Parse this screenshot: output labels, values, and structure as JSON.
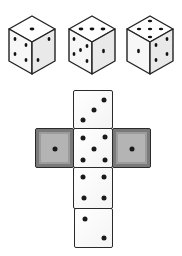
{
  "colors": {
    "outline": "#2a2a2a",
    "pip": "#1a1a1a",
    "face": "#ffffff",
    "shaded_face": "#9c9c9c"
  },
  "dice": [
    {
      "label": "die-1",
      "top": 1,
      "left": 4,
      "right": 2
    },
    {
      "label": "die-2",
      "top": 3,
      "left": 5,
      "right": 1
    },
    {
      "label": "die-3",
      "top": 5,
      "left": 1,
      "right": 4
    }
  ],
  "net": {
    "faces": [
      {
        "position": "top",
        "value": 3,
        "shaded": false
      },
      {
        "position": "left",
        "value": 1,
        "shaded": true
      },
      {
        "position": "center",
        "value": 5,
        "shaded": false
      },
      {
        "position": "right",
        "value": 1,
        "shaded": true
      },
      {
        "position": "below-center",
        "value": 4,
        "shaded": false
      },
      {
        "position": "bottom",
        "value": 2,
        "shaded": false
      }
    ]
  }
}
